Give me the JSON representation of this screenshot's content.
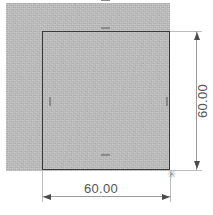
{
  "view": {
    "name": "cad-sketch-view",
    "width": 213,
    "height": 215,
    "background_color": "#ffffff"
  },
  "geometry": {
    "face": {
      "label": "shaded-face",
      "fill_color": "#b9b9b9"
    },
    "profile": {
      "label": "square-profile",
      "line_color": "#3a3a3a"
    }
  },
  "constraints": [
    {
      "id": "horizontal-top-cut",
      "type": "horizontal",
      "glyph": "horizontal-relation"
    },
    {
      "id": "horizontal-top",
      "type": "horizontal",
      "glyph": "horizontal-relation"
    },
    {
      "id": "horizontal-bottom",
      "type": "horizontal",
      "glyph": "horizontal-relation"
    },
    {
      "id": "vertical-left",
      "type": "vertical",
      "glyph": "vertical-relation"
    },
    {
      "id": "vertical-right",
      "type": "vertical",
      "glyph": "vertical-relation"
    }
  ],
  "dimensions": {
    "horizontal": {
      "value": "60.00",
      "orientation": "horizontal",
      "text_color": "#555555"
    },
    "vertical": {
      "value": "60.00",
      "orientation": "vertical",
      "text_color": "#555555"
    }
  },
  "markers": {
    "selected_point": {
      "glyph": "✳",
      "label": "sketch-point"
    }
  }
}
